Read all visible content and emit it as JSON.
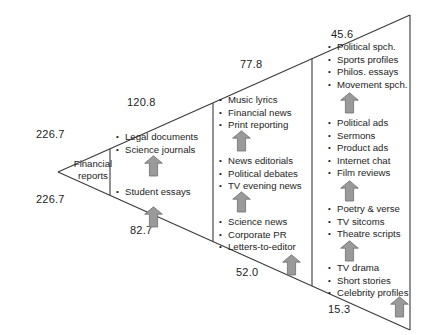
{
  "diagram": {
    "type": "wedge-continuum-diagram",
    "apex_label": "Financial\nreports",
    "apex_label_line1": "Financial",
    "apex_label_line2": "reports",
    "colors": {
      "line": "#3a3a3a",
      "arrow_fill": "#9a9a9a",
      "arrow_stroke": "#6d6d6d",
      "text": "#1d1d1d",
      "background": "#ffffff"
    },
    "edge_values": {
      "top_left": "226.7",
      "bottom_left": "226.7",
      "top_second": "120.8",
      "bottom_second": "82.7",
      "top_third": "77.8",
      "bottom_third": "52.0",
      "top_right": "45.6",
      "bottom_right": "15.3"
    },
    "bands": [
      {
        "id": "band-1",
        "column": 2,
        "groups": [
          {
            "items": [
              "Legal documents",
              "Science journals"
            ]
          },
          {
            "items": [
              "Student essays"
            ]
          }
        ]
      },
      {
        "id": "band-2",
        "column": 3,
        "groups": [
          {
            "items": [
              "Music lyrics",
              "Financial news",
              "Print reporting"
            ]
          },
          {
            "items": [
              "News editorials",
              "Political debates",
              "TV evening news"
            ]
          },
          {
            "items": [
              "Science news",
              "Corporate PR",
              "Letters-to-editor"
            ]
          }
        ]
      },
      {
        "id": "band-3",
        "column": 4,
        "groups": [
          {
            "items": [
              "Political spch.",
              "Sports profiles",
              "Philos. essays",
              "Movement spch."
            ]
          },
          {
            "items": [
              "Political ads",
              "Sermons",
              "Product ads",
              "Internet chat",
              "Film reviews"
            ]
          },
          {
            "items": [
              "Poetry & verse",
              "TV sitcoms",
              "Theatre scripts"
            ]
          },
          {
            "items": [
              "TV drama",
              "Short stories",
              "Celebrity profiles"
            ]
          }
        ]
      }
    ],
    "arrows": [
      {
        "id": "arrow-1",
        "name": "up-arrow-band1"
      },
      {
        "id": "arrow-2",
        "name": "up-arrow-band1-lower"
      },
      {
        "id": "arrow-3",
        "name": "up-arrow-band2-upper"
      },
      {
        "id": "arrow-4",
        "name": "up-arrow-band2-middle"
      },
      {
        "id": "arrow-5",
        "name": "up-arrow-band2-lower"
      },
      {
        "id": "arrow-6",
        "name": "up-arrow-band3-upper"
      },
      {
        "id": "arrow-7",
        "name": "up-arrow-band3-second"
      },
      {
        "id": "arrow-8",
        "name": "up-arrow-band3-third"
      },
      {
        "id": "arrow-9",
        "name": "up-arrow-band3-lower"
      }
    ]
  }
}
